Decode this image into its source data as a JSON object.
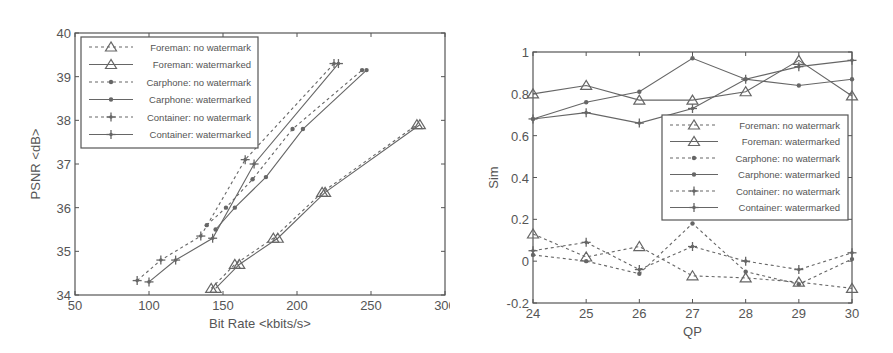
{
  "chart_data": [
    {
      "type": "line",
      "title": "",
      "xlabel": "Bit Rate <kbits/s>",
      "ylabel": "PSNR <dB>",
      "xlim": [
        50,
        300
      ],
      "ylim": [
        34,
        40
      ],
      "xticks": [
        50,
        100,
        150,
        200,
        250,
        300
      ],
      "yticks": [
        34,
        35,
        36,
        37,
        38,
        39,
        40
      ],
      "grid": false,
      "legend_position": "upper left",
      "series": [
        {
          "name": "Foreman: no watermark",
          "style": "dashed",
          "marker": "triangle",
          "x": [
            142,
            158,
            184,
            217,
            281
          ],
          "y": [
            34.15,
            34.7,
            35.3,
            36.35,
            37.9
          ]
        },
        {
          "name": "Foreman: watermarked",
          "style": "solid",
          "marker": "triangle",
          "x": [
            145,
            161,
            187,
            219,
            283
          ],
          "y": [
            34.15,
            34.7,
            35.3,
            36.35,
            37.9
          ]
        },
        {
          "name": "Carphone: no watermark",
          "style": "dashed",
          "marker": "dot",
          "x": [
            139,
            152,
            170,
            197,
            244
          ],
          "y": [
            35.6,
            36.0,
            36.65,
            37.8,
            39.15
          ]
        },
        {
          "name": "Carphone: watermarked",
          "style": "solid",
          "marker": "dot",
          "x": [
            145,
            158,
            179,
            204,
            247
          ],
          "y": [
            35.5,
            36.0,
            36.7,
            37.8,
            39.15
          ]
        },
        {
          "name": "Container: no watermark",
          "style": "dashed",
          "marker": "star",
          "x": [
            92,
            108,
            135,
            165,
            225
          ],
          "y": [
            34.33,
            34.8,
            35.35,
            37.1,
            39.3
          ]
        },
        {
          "name": "Container: watermarked",
          "style": "solid",
          "marker": "star",
          "x": [
            100,
            118,
            143,
            171,
            228
          ],
          "y": [
            34.3,
            34.8,
            35.3,
            37.0,
            39.3
          ]
        }
      ]
    },
    {
      "type": "line",
      "title": "",
      "xlabel": "QP",
      "ylabel": "Sim",
      "xlim": [
        24,
        30
      ],
      "ylim": [
        -0.2,
        1
      ],
      "xticks": [
        24,
        25,
        26,
        27,
        28,
        29,
        30
      ],
      "yticks": [
        -0.2,
        0,
        0.2,
        0.4,
        0.6,
        0.8,
        1
      ],
      "grid": false,
      "legend_position": "center right",
      "series": [
        {
          "name": "Foreman: no watermark",
          "style": "dashed",
          "marker": "triangle",
          "x": [
            24,
            25,
            26,
            27,
            28,
            29,
            30
          ],
          "y": [
            0.13,
            0.02,
            0.07,
            -0.07,
            -0.08,
            -0.1,
            -0.13
          ]
        },
        {
          "name": "Foreman: watermarked",
          "style": "solid",
          "marker": "triangle",
          "x": [
            24,
            25,
            26,
            27,
            28,
            29,
            30
          ],
          "y": [
            0.8,
            0.84,
            0.77,
            0.77,
            0.81,
            0.96,
            0.79
          ]
        },
        {
          "name": "Carphone: no watermark",
          "style": "dashed",
          "marker": "dot",
          "x": [
            24,
            25,
            26,
            27,
            28,
            29,
            30
          ],
          "y": [
            0.03,
            0.0,
            -0.06,
            0.18,
            -0.05,
            -0.11,
            0.01
          ]
        },
        {
          "name": "Carphone: watermarked",
          "style": "solid",
          "marker": "dot",
          "x": [
            24,
            25,
            26,
            27,
            28,
            29,
            30
          ],
          "y": [
            0.68,
            0.76,
            0.81,
            0.97,
            0.87,
            0.84,
            0.87
          ]
        },
        {
          "name": "Container: no watermark",
          "style": "dashed",
          "marker": "star",
          "x": [
            24,
            25,
            26,
            27,
            28,
            29,
            30
          ],
          "y": [
            0.05,
            0.09,
            -0.04,
            0.07,
            0.0,
            -0.04,
            0.04
          ]
        },
        {
          "name": "Container: watermarked",
          "style": "solid",
          "marker": "star",
          "x": [
            24,
            25,
            26,
            27,
            28,
            29,
            30
          ],
          "y": [
            0.68,
            0.71,
            0.66,
            0.73,
            0.87,
            0.93,
            0.96
          ]
        }
      ]
    }
  ],
  "layout": {
    "left": {
      "plot": {
        "x0": 75,
        "x1": 445,
        "y0": 33,
        "y1": 295
      },
      "legend": {
        "x": 81,
        "y": 37,
        "w": 177,
        "h": 111,
        "row_h": 17.5,
        "line_x0": 8,
        "line_x1": 52,
        "text_x": 170
      }
    },
    "right": {
      "plot": {
        "x0": 93,
        "x1": 412,
        "y0": 52,
        "y1": 303
      },
      "legend": {
        "x": 222,
        "y": 115,
        "w": 186,
        "h": 105,
        "row_h": 16.5,
        "line_x0": 8,
        "line_x1": 56,
        "text_x": 178
      }
    }
  },
  "style": {
    "line_color": "#666666",
    "axis_color": "#555555",
    "text_color": "#555555"
  }
}
